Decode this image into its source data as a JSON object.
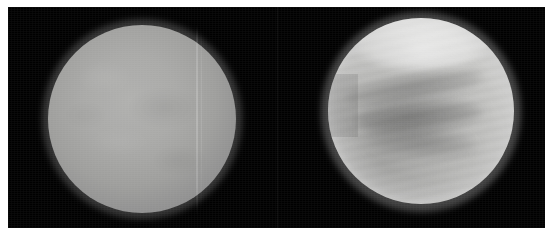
{
  "figure": {
    "background_color": "#000000",
    "page_color": "#ffffff",
    "caption": "",
    "width_px": 553,
    "height_px": 244
  },
  "plate": {
    "left_px": 8,
    "top_px": 7,
    "width_px": 537,
    "height_px": 221,
    "fill": "#000000"
  },
  "panels": [
    {
      "id": "visible",
      "name": "visible-light-view",
      "label": "",
      "disk": {
        "center_x_px": 142,
        "center_y_px": 124,
        "radius_px": 94,
        "appearance": "featureless pale grey cloud deck",
        "limb_color": "#545454",
        "core_color": "#b0b0ae",
        "artifact": "faint vertical scan line near right side of disk"
      }
    },
    {
      "id": "ultraviolet",
      "name": "ultraviolet-view",
      "label": "",
      "disk": {
        "center_x_px": 413,
        "center_y_px": 121,
        "radius_px": 93,
        "appearance": "mottled cloud bands with bright polar hood and dark mid-latitude V-shaped bands",
        "limb_color": "#8e8e8e",
        "core_color": "#cfcfcd",
        "features": [
          "bright polar hood",
          "dark equatorial cloud band",
          "fine cloud striations",
          "frayed left limb",
          "bright upper-right limb crescent"
        ]
      }
    }
  ]
}
